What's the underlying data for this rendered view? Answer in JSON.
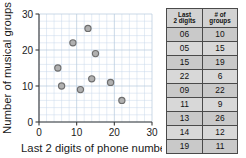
{
  "chart_data": {
    "type": "scatter",
    "title": "",
    "xlabel": "Last 2 digits of phone number",
    "ylabel": "Number of musical groups",
    "xlim": [
      0,
      30
    ],
    "ylim": [
      0,
      30
    ],
    "xticks": [
      "0",
      "10",
      "20",
      "30"
    ],
    "yticks": [
      "0",
      "10",
      "20",
      "30"
    ],
    "xtick_values": [
      0,
      10,
      20,
      30
    ],
    "ytick_values": [
      0,
      10,
      20,
      30
    ],
    "grid": true,
    "grid_step": 2,
    "legend": "none",
    "marker": "circle",
    "marker_fill": "#b0b0b0",
    "marker_edge": "#6e6e6e",
    "points": [
      {
        "x": 6,
        "y": 10
      },
      {
        "x": 5,
        "y": 15
      },
      {
        "x": 15,
        "y": 19
      },
      {
        "x": 22,
        "y": 6
      },
      {
        "x": 9,
        "y": 22
      },
      {
        "x": 11,
        "y": 9
      },
      {
        "x": 13,
        "y": 26
      },
      {
        "x": 14,
        "y": 12
      },
      {
        "x": 19,
        "y": 11
      }
    ]
  },
  "table": {
    "headers": [
      {
        "line1": "Last",
        "line2": "2 digits"
      },
      {
        "line1": "# of",
        "line2": "groups"
      }
    ],
    "rows": [
      {
        "digits": "06",
        "groups": "10"
      },
      {
        "digits": "05",
        "groups": "15"
      },
      {
        "digits": "15",
        "groups": "19"
      },
      {
        "digits": "22",
        "groups": "6"
      },
      {
        "digits": "09",
        "groups": "22"
      },
      {
        "digits": "11",
        "groups": "9"
      },
      {
        "digits": "13",
        "groups": "26"
      },
      {
        "digits": "14",
        "groups": "12"
      },
      {
        "digits": "19",
        "groups": "11"
      }
    ]
  }
}
